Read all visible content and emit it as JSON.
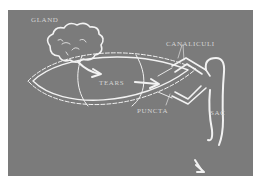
{
  "diagram": {
    "background_color": "#7b7b7b",
    "line_color": "#f2f2f2",
    "label_color": "#d4d4d4",
    "labels": {
      "gland": "GLAND",
      "tears": "TEARS",
      "canaliculi": "CANALICULI",
      "puncta": "PUNCTA",
      "sac": "SAC"
    },
    "nodes": [
      {
        "id": "gland",
        "label": "GLAND",
        "shape": "cloud"
      },
      {
        "id": "eye",
        "label": "TEARS",
        "shape": "eye"
      },
      {
        "id": "puncta",
        "label": "PUNCTA",
        "shape": "openings"
      },
      {
        "id": "canaliculi",
        "label": "CANALICULI",
        "shape": "tubes"
      },
      {
        "id": "sac",
        "label": "SAC",
        "shape": "duct"
      }
    ],
    "edges": [
      {
        "from": "gland",
        "to": "eye",
        "type": "arrow"
      },
      {
        "from": "eye",
        "to": "puncta",
        "type": "arrow"
      },
      {
        "from": "puncta",
        "to": "canaliculi",
        "type": "line"
      },
      {
        "from": "canaliculi",
        "to": "sac",
        "type": "line"
      },
      {
        "from": "sac",
        "to": "nose",
        "type": "arrow"
      }
    ]
  }
}
